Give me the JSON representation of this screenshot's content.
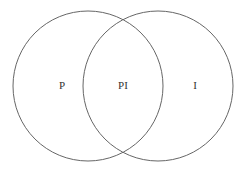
{
  "diagram": {
    "type": "venn",
    "sets": [
      {
        "id": "left",
        "label": "P",
        "cx": 88,
        "cy": 86,
        "r": 75
      },
      {
        "id": "right",
        "label": "I",
        "cx": 158,
        "cy": 86,
        "r": 75
      }
    ],
    "intersection_label": "PI",
    "stroke_color": "#666666"
  }
}
